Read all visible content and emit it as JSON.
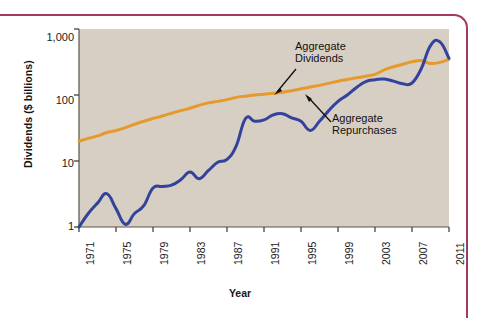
{
  "figure": {
    "background_color": "#ffffff",
    "plot_background_color": "#d8cfc4",
    "border_color": "#a33a5e"
  },
  "chart_data": {
    "type": "line",
    "title": "",
    "xlabel": "Year",
    "ylabel": "Dividends ($ billions)",
    "yscale": "log",
    "ylim": [
      1,
      1000
    ],
    "xlim": [
      1971,
      2011
    ],
    "grid": false,
    "legend_position": "annotations-inline",
    "ytick_labels": [
      "1,000",
      "100",
      "10",
      "1"
    ],
    "ytick_values": [
      1000,
      100,
      10,
      1
    ],
    "xtick_labels": [
      "1971",
      "1975",
      "1979",
      "1983",
      "1987",
      "1991",
      "1995",
      "1999",
      "2003",
      "2007",
      "2011"
    ],
    "xtick_values": [
      1971,
      1975,
      1979,
      1983,
      1987,
      1991,
      1995,
      1999,
      2003,
      2007,
      2011
    ],
    "x": [
      1971,
      1972,
      1973,
      1974,
      1975,
      1976,
      1977,
      1978,
      1979,
      1980,
      1981,
      1982,
      1983,
      1984,
      1985,
      1986,
      1987,
      1988,
      1989,
      1990,
      1991,
      1992,
      1993,
      1994,
      1995,
      1996,
      1997,
      1998,
      1999,
      2000,
      2001,
      2002,
      2003,
      2004,
      2005,
      2006,
      2007,
      2008,
      2009,
      2010,
      2011
    ],
    "series": [
      {
        "name": "Aggregate Dividends",
        "color": "#e69a2c",
        "values": [
          20,
          22,
          24,
          27,
          29,
          32,
          36,
          40,
          44,
          48,
          53,
          58,
          63,
          70,
          76,
          80,
          85,
          92,
          96,
          100,
          103,
          106,
          110,
          116,
          124,
          132,
          140,
          150,
          162,
          172,
          182,
          192,
          205,
          240,
          268,
          292,
          318,
          332,
          300,
          312,
          348
        ]
      },
      {
        "name": "Aggregate Repurchases",
        "color": "#33439c",
        "values": [
          1.0,
          1.6,
          2.3,
          3.2,
          1.9,
          1.1,
          1.6,
          2.1,
          3.9,
          4.1,
          4.3,
          5.2,
          6.8,
          5.4,
          7.2,
          9.6,
          10.6,
          17.0,
          44.0,
          40.0,
          42.0,
          50.0,
          52.0,
          45.0,
          40.0,
          29.0,
          40.0,
          58.0,
          80.0,
          100.0,
          130.0,
          160.0,
          170.0,
          175.0,
          162.0,
          148.0,
          152.0,
          250.0,
          560.0,
          640.0,
          360.0
        ]
      }
    ],
    "annotations": [
      {
        "label": "Aggregate\nDividends",
        "target_series": "Aggregate Dividends"
      },
      {
        "label": "Aggregate\nRepurchases",
        "target_series": "Aggregate Repurchases"
      }
    ]
  }
}
